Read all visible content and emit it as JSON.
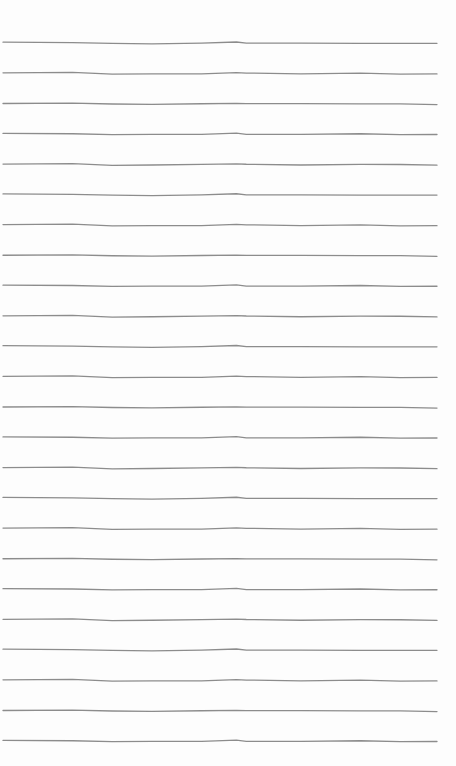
{
  "paper": {
    "type": "ruled-lines",
    "line_count": 24,
    "first_line_y": 43,
    "line_spacing": 30.35,
    "line_x_start": 3,
    "line_x_end": 437,
    "line_color": "#8c8c8c",
    "background": "#fdfdfd"
  }
}
